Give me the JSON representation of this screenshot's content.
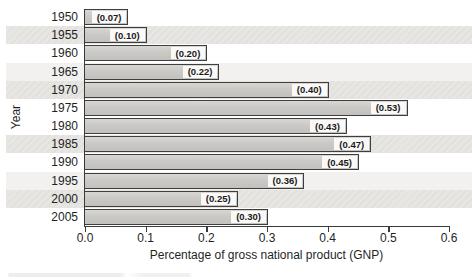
{
  "chart_data": {
    "type": "bar",
    "orientation": "horizontal",
    "title": "",
    "xlabel": "Percentage of gross national product (GNP)",
    "ylabel": "Year",
    "categories": [
      "1950",
      "1955",
      "1960",
      "1965",
      "1970",
      "1975",
      "1980",
      "1985",
      "1990",
      "1995",
      "2000",
      "2005"
    ],
    "values": [
      0.07,
      0.1,
      0.2,
      0.22,
      0.4,
      0.53,
      0.43,
      0.47,
      0.45,
      0.36,
      0.25,
      0.3
    ],
    "bar_labels": [
      "(0.07)",
      "(0.10)",
      "(0.20)",
      "(0.22)",
      "(0.40)",
      "(0.53)",
      "(0.43)",
      "(0.47)",
      "(0.45)",
      "(0.36)",
      "(0.25)",
      "(0.30)"
    ],
    "xlim": [
      0.0,
      0.6
    ],
    "xticks": [
      "0.0",
      "0.1",
      "0.2",
      "0.3",
      "0.4",
      "0.5",
      "0.6"
    ],
    "grid": false,
    "legend": "none",
    "background_bands": {
      "strong_rows": [
        1,
        4,
        7,
        10
      ],
      "faint_rows": [
        3,
        9
      ]
    },
    "colors": {
      "bar_fill": "#cbc9c6",
      "bar_border": "#3e3e3e",
      "label_chip_bg": "#faf9f7",
      "band_strong": "#e7e6e3",
      "band_faint": "#f2f1ef",
      "text": "#1f1f1f",
      "axis": "#3a3a3a",
      "page_background": "#ffffff"
    }
  }
}
